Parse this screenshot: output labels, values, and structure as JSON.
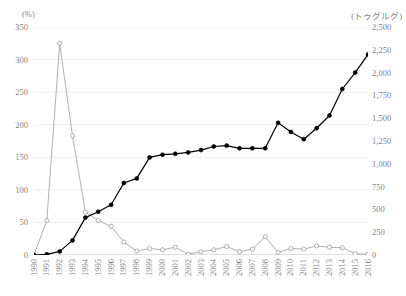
{
  "chart_data": {
    "type": "line",
    "title": "",
    "subtitle": "",
    "xlabel": "",
    "ylabel": "(%)",
    "y2label": "(トゥグルグ)",
    "grid": true,
    "legend": "none",
    "ylim": [
      0,
      350
    ],
    "y2lim": [
      0,
      2500
    ],
    "y_ticks": [
      "0",
      "50",
      "100",
      "150",
      "200",
      "250",
      "300",
      "350"
    ],
    "y2_ticks": [
      "0",
      "250",
      "500",
      "750",
      "1,000",
      "1,250",
      "1,500",
      "1,750",
      "2,000",
      "2,250",
      "2,500"
    ],
    "x": [
      "1990",
      "1991",
      "1992",
      "1993",
      "1994",
      "1995",
      "1996",
      "1997",
      "1998",
      "1999",
      "2000",
      "2001",
      "2002",
      "2003",
      "2004",
      "2005",
      "2006",
      "2007",
      "2008",
      "2009",
      "2010",
      "2011",
      "2012",
      "2013",
      "2014",
      "2015",
      "2016"
    ],
    "series": [
      {
        "name": "inflation-rate-percent",
        "axis": "left",
        "marker": "open-circle",
        "color": "#a6a6a6",
        "values": [
          0,
          53,
          325,
          183,
          66,
          53,
          44,
          20,
          6,
          10,
          8,
          12,
          1,
          5,
          8,
          13,
          5,
          9,
          28,
          4,
          10,
          9,
          14,
          12,
          11,
          2,
          1
        ]
      },
      {
        "name": "exchange-rate-tugrik",
        "axis": "right",
        "marker": "filled-circle",
        "color": "#000000",
        "values": [
          0,
          8,
          40,
          160,
          410,
          475,
          550,
          790,
          840,
          1070,
          1100,
          1110,
          1125,
          1150,
          1190,
          1200,
          1170,
          1170,
          1170,
          1450,
          1350,
          1270,
          1390,
          1530,
          1820,
          2000,
          2200
        ]
      }
    ]
  }
}
